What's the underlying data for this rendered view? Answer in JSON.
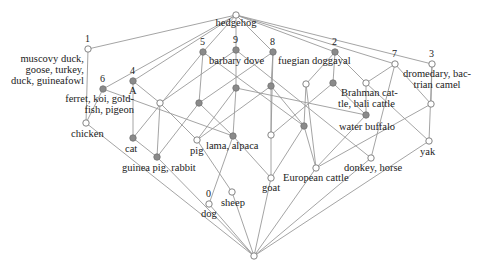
{
  "diagram": {
    "type": "concept-lattice",
    "edge_color": "#9a9a9a",
    "node_fill_gray": "#8a8a8a",
    "node_fill_open": "#ffffff",
    "nodes": [
      {
        "id": "top",
        "x": 236,
        "y": 15,
        "fill": "open"
      },
      {
        "id": "n1",
        "x": 88,
        "y": 49,
        "fill": "open"
      },
      {
        "id": "n6",
        "x": 103,
        "y": 89,
        "fill": "gray"
      },
      {
        "id": "n4",
        "x": 133,
        "y": 81,
        "fill": "gray"
      },
      {
        "id": "n5",
        "x": 203,
        "y": 52,
        "fill": "gray"
      },
      {
        "id": "n9",
        "x": 236,
        "y": 50,
        "fill": "gray"
      },
      {
        "id": "n8",
        "x": 273,
        "y": 52,
        "fill": "gray"
      },
      {
        "id": "n2",
        "x": 335,
        "y": 52,
        "fill": "gray"
      },
      {
        "id": "n7",
        "x": 395,
        "y": 64,
        "fill": "open"
      },
      {
        "id": "n3",
        "x": 432,
        "y": 64,
        "fill": "open"
      },
      {
        "id": "chicken",
        "x": 86,
        "y": 123,
        "fill": "open"
      },
      {
        "id": "cat",
        "x": 133,
        "y": 138,
        "fill": "gray"
      },
      {
        "id": "guinea",
        "x": 157,
        "y": 157,
        "fill": "gray"
      },
      {
        "id": "w1",
        "x": 160,
        "y": 103,
        "fill": "open"
      },
      {
        "id": "g1",
        "x": 199,
        "y": 103,
        "fill": "gray"
      },
      {
        "id": "pig",
        "x": 197,
        "y": 140,
        "fill": "open"
      },
      {
        "id": "lama",
        "x": 233,
        "y": 136,
        "fill": "gray"
      },
      {
        "id": "g2",
        "x": 236,
        "y": 88,
        "fill": "gray"
      },
      {
        "id": "g3",
        "x": 271,
        "y": 86,
        "fill": "gray"
      },
      {
        "id": "g4",
        "x": 304,
        "y": 126,
        "fill": "gray"
      },
      {
        "id": "w2",
        "x": 306,
        "y": 84,
        "fill": "open"
      },
      {
        "id": "brahman",
        "x": 333,
        "y": 83,
        "fill": "gray"
      },
      {
        "id": "w3",
        "x": 366,
        "y": 83,
        "fill": "open"
      },
      {
        "id": "buffalo",
        "x": 366,
        "y": 115,
        "fill": "gray"
      },
      {
        "id": "w4",
        "x": 271,
        "y": 135,
        "fill": "open"
      },
      {
        "id": "goat",
        "x": 271,
        "y": 178,
        "fill": "open"
      },
      {
        "id": "european",
        "x": 316,
        "y": 168,
        "fill": "open"
      },
      {
        "id": "donkey",
        "x": 371,
        "y": 158,
        "fill": "open"
      },
      {
        "id": "yak",
        "x": 429,
        "y": 141,
        "fill": "open"
      },
      {
        "id": "w5",
        "x": 431,
        "y": 104,
        "fill": "open"
      },
      {
        "id": "dog",
        "x": 209,
        "y": 204,
        "fill": "open"
      },
      {
        "id": "sheep",
        "x": 232,
        "y": 192,
        "fill": "open"
      },
      {
        "id": "bottom",
        "x": 254,
        "y": 256,
        "fill": "open"
      }
    ],
    "edges": [
      [
        "top",
        "n1"
      ],
      [
        "top",
        "n4"
      ],
      [
        "top",
        "n6"
      ],
      [
        "top",
        "n5"
      ],
      [
        "top",
        "n9"
      ],
      [
        "top",
        "n8"
      ],
      [
        "top",
        "n2"
      ],
      [
        "top",
        "n7"
      ],
      [
        "top",
        "n3"
      ],
      [
        "n1",
        "chicken"
      ],
      [
        "n6",
        "chicken"
      ],
      [
        "n6",
        "lama"
      ],
      [
        "n4",
        "cat"
      ],
      [
        "n4",
        "w1"
      ],
      [
        "n5",
        "g1"
      ],
      [
        "n5",
        "cat"
      ],
      [
        "n5",
        "g4"
      ],
      [
        "n9",
        "g2"
      ],
      [
        "n9",
        "w1"
      ],
      [
        "n9",
        "donkey"
      ],
      [
        "n8",
        "g3"
      ],
      [
        "n8",
        "g1"
      ],
      [
        "n8",
        "w4"
      ],
      [
        "n2",
        "brahman"
      ],
      [
        "n2",
        "w2"
      ],
      [
        "n2",
        "w3"
      ],
      [
        "n7",
        "w3"
      ],
      [
        "n7",
        "w5"
      ],
      [
        "n7",
        "donkey"
      ],
      [
        "n3",
        "w5"
      ],
      [
        "n3",
        "yak"
      ],
      [
        "w1",
        "guinea"
      ],
      [
        "w1",
        "pig"
      ],
      [
        "g1",
        "guinea"
      ],
      [
        "g1",
        "lama"
      ],
      [
        "g2",
        "lama"
      ],
      [
        "g2",
        "pig"
      ],
      [
        "g2",
        "buffalo"
      ],
      [
        "g3",
        "w4"
      ],
      [
        "g3",
        "g4"
      ],
      [
        "g3",
        "pig"
      ],
      [
        "w2",
        "g4"
      ],
      [
        "w2",
        "european"
      ],
      [
        "brahman",
        "buffalo"
      ],
      [
        "brahman",
        "w4"
      ],
      [
        "w3",
        "yak"
      ],
      [
        "w3",
        "buffalo"
      ],
      [
        "buffalo",
        "european"
      ],
      [
        "w5",
        "european"
      ],
      [
        "cat",
        "guinea"
      ],
      [
        "pig",
        "sheep"
      ],
      [
        "lama",
        "goat"
      ],
      [
        "lama",
        "dog"
      ],
      [
        "w4",
        "goat"
      ],
      [
        "g4",
        "european"
      ],
      [
        "g4",
        "goat"
      ],
      [
        "chicken",
        "bottom"
      ],
      [
        "guinea",
        "bottom"
      ],
      [
        "sheep",
        "bottom"
      ],
      [
        "dog",
        "bottom"
      ],
      [
        "goat",
        "bottom"
      ],
      [
        "european",
        "bottom"
      ],
      [
        "donkey",
        "bottom"
      ],
      [
        "yak",
        "bottom"
      ]
    ]
  },
  "labels": {
    "top": "hedgehog",
    "n1_num": "1",
    "n1_text": [
      "muscovy duck,",
      "goose, turkey,",
      "duck, guineafowl"
    ],
    "n6_num": "6",
    "n6_text": [
      "ferret, koi, gold-",
      "fish, pigeon"
    ],
    "n4_num": "4",
    "n4_letter": "A",
    "n5_num": "5",
    "n9_num": "9",
    "n9_text": "barbary dove",
    "n8_num": "8",
    "n8_text": "fuegian doggayal",
    "n2_num": "2",
    "n7_num": "7",
    "n3_num": "3",
    "n3_text": [
      "dromedary, bac-",
      "trian camel"
    ],
    "brahman_text": [
      "Brahman cat-",
      "tle, bali cattle"
    ],
    "buffalo_text": "water buffalo",
    "chicken": "chicken",
    "cat": "cat",
    "guinea": "guinea pig, rabbit",
    "pig": "pig",
    "lama": "lama, alpaca",
    "goat": "goat",
    "european": "European cattle",
    "donkey": "donkey, horse",
    "yak": "yak",
    "dog_num": "0",
    "dog": "dog",
    "sheep": "sheep"
  }
}
